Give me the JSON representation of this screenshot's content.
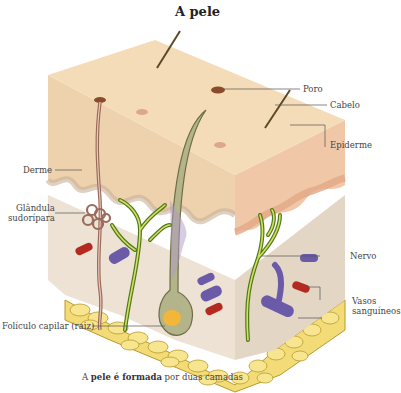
{
  "title": "A pele",
  "labels": {
    "poro": "Poro",
    "cabelo": "Cabelo",
    "epiderme": "Epiderme",
    "derme": "Derme",
    "glandula_line1": "Glândula",
    "glandula_line2": "sudorípara",
    "nervo": "Nervo",
    "vasos_line1": "Vasos",
    "vasos_line2": "sanguíneos",
    "foliculo": "Folículo capilar (raiz)"
  },
  "caption": {
    "prefix": "A ",
    "bold": "pele é formada",
    "suffix": " por duas camadas"
  },
  "colors": {
    "epidermis_top": "#f5dcb8",
    "epidermis_side": "#eed2ad",
    "dermis": "#ede2d4",
    "fat": "#f3dc78",
    "fat_outline": "#b89a2c",
    "nerve": "#c8d84a",
    "nerve_outline": "#4e7a1c",
    "vein": "#6a5aa8",
    "artery": "#b42a20",
    "gland": "#9b6b5c"
  }
}
